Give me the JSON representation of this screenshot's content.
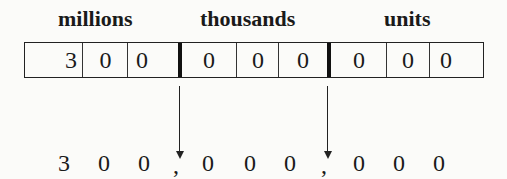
{
  "groups": [
    {
      "label": "millions",
      "digits": [
        "3",
        "0",
        "0"
      ]
    },
    {
      "label": "thousands",
      "digits": [
        "0",
        "0",
        "0"
      ]
    },
    {
      "label": "units",
      "digits": [
        "0",
        "0",
        "0"
      ]
    }
  ],
  "number_line": {
    "digits": [
      "3",
      "0",
      "0",
      "0",
      "0",
      "0",
      "0",
      "0",
      "0"
    ],
    "separator": ","
  }
}
